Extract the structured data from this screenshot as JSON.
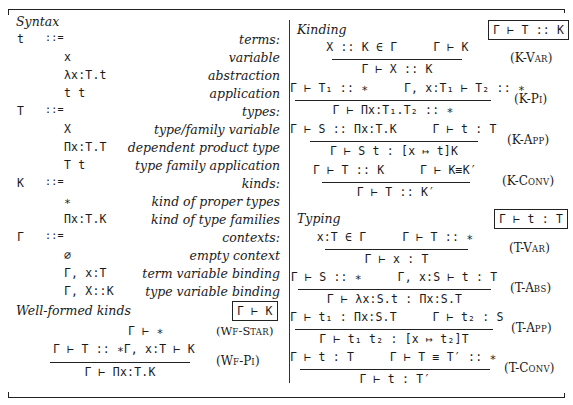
{
  "syntax": {
    "heading": "Syntax",
    "groups": [
      {
        "meta": "t",
        "assign": "::=",
        "desc": "terms:",
        "productions": [
          {
            "form": "x",
            "desc": "variable"
          },
          {
            "form": "λx:T.t",
            "desc": "abstraction"
          },
          {
            "form": "t t",
            "desc": "application"
          }
        ]
      },
      {
        "meta": "T",
        "assign": "::=",
        "desc": "types:",
        "productions": [
          {
            "form": "X",
            "desc": "type/family variable"
          },
          {
            "form": "Πx:T.T",
            "desc": "dependent product type"
          },
          {
            "form": "T t",
            "desc": "type family application"
          }
        ]
      },
      {
        "meta": "K",
        "assign": "::=",
        "desc": "kinds:",
        "productions": [
          {
            "form": "∗",
            "desc": "kind of proper types"
          },
          {
            "form": "Πx:T.K",
            "desc": "kind of type families"
          }
        ]
      },
      {
        "meta": "Γ",
        "assign": "::=",
        "desc": "contexts:",
        "productions": [
          {
            "form": "∅",
            "desc": "empty context"
          },
          {
            "form": "Γ, x:T",
            "desc": "term variable binding"
          },
          {
            "form": "Γ, X::K",
            "desc": "type variable binding"
          }
        ]
      }
    ]
  },
  "well_formed_kinds": {
    "heading": "Well-formed kinds",
    "judgment": "Γ ⊢ K",
    "rules": [
      {
        "name_prefix": "(W",
        "name_sc": "F",
        "name_mid": "-S",
        "name_sc2": "TAR",
        "name_suffix": ")",
        "axiom": "Γ ⊢ ∗",
        "full_name": "(WF-STAR)"
      },
      {
        "full_name": "(WF-PI)",
        "premise1": "Γ ⊢ T :: ∗",
        "premise2": "Γ, x:T ⊢ K",
        "conclusion": "Γ ⊢ Πx:T.K"
      }
    ]
  },
  "kinding": {
    "heading": "Kinding",
    "judgment": "Γ ⊢ T :: K",
    "rules": [
      {
        "full_name": "(K-VAR)",
        "premise1": "X :: K ∈ Γ",
        "premise2": "Γ ⊢ K",
        "conclusion": "Γ ⊢ X :: K"
      },
      {
        "full_name": "(K-PI)",
        "premise1": "Γ ⊢ T₁ :: ∗",
        "premise2": "Γ, x:T₁ ⊢ T₂ :: ∗",
        "conclusion": "Γ ⊢ Πx:T₁.T₂ :: ∗"
      },
      {
        "full_name": "(K-APP)",
        "premise1": "Γ ⊢ S :: Πx:T.K",
        "premise2": "Γ ⊢ t : T",
        "conclusion": "Γ ⊢ S t : [x ↦ t]K"
      },
      {
        "full_name": "(K-CONV)",
        "premise1": "Γ ⊢ T :: K",
        "premise2": "Γ ⊢ K≡K′",
        "conclusion": "Γ ⊢ T :: K′"
      }
    ]
  },
  "typing": {
    "heading": "Typing",
    "judgment": "Γ ⊢ t : T",
    "rules": [
      {
        "full_name": "(T-VAR)",
        "premise1": "x:T ∈ Γ",
        "premise2": "Γ ⊢ T :: ∗",
        "conclusion": "Γ ⊢ x : T"
      },
      {
        "full_name": "(T-ABS)",
        "premise1": "Γ ⊢ S :: ∗",
        "premise2": "Γ, x:S ⊢ t : T",
        "conclusion": "Γ ⊢ λx:S.t : Πx:S.T"
      },
      {
        "full_name": "(T-APP)",
        "premise1": "Γ ⊢ t₁ : Πx:S.T",
        "premise2": "Γ ⊢ t₂ : S",
        "conclusion": "Γ ⊢ t₁ t₂ : [x ↦ t₂]T"
      },
      {
        "full_name": "(T-CONV)",
        "premise1": "Γ ⊢ t : T",
        "premise2": "Γ ⊢ T ≡ T′ :: ∗",
        "conclusion": "Γ ⊢ t : T′"
      }
    ]
  },
  "rule_labels": {
    "wf_star": {
      "a": "(W",
      "b": "F",
      "c": "-S",
      "d": "TAR",
      "e": ")"
    },
    "wf_pi": {
      "a": "(W",
      "b": "F",
      "c": "-P",
      "d": "I",
      "e": ")"
    },
    "k_var": {
      "a": "(K-V",
      "b": "AR",
      "c": ")"
    },
    "k_pi": {
      "a": "(K-P",
      "b": "I",
      "c": ")"
    },
    "k_app": {
      "a": "(K-A",
      "b": "PP",
      "c": ")"
    },
    "k_conv": {
      "a": "(K-C",
      "b": "ONV",
      "c": ")"
    },
    "t_var": {
      "a": "(T-V",
      "b": "AR",
      "c": ")"
    },
    "t_abs": {
      "a": "(T-A",
      "b": "BS",
      "c": ")"
    },
    "t_app": {
      "a": "(T-A",
      "b": "PP",
      "c": ")"
    },
    "t_conv": {
      "a": "(T-C",
      "b": "ONV",
      "c": ")"
    }
  }
}
